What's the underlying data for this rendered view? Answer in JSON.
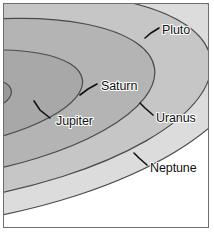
{
  "figure": {
    "background_color": "#ffffff",
    "frame_color": "#6e6e6e"
  },
  "sun": {
    "name": "Sun",
    "color": "#000000",
    "cx": -52,
    "cy": 96,
    "rx": 6.0,
    "ry": 4.2
  },
  "chart_data": {
    "type": "scatter",
    "subtitle": "Concentric tilted ellipses representing planetary orbits viewed obliquely",
    "xlabel": "",
    "ylabel": "",
    "grid": false,
    "legend": "none",
    "center": {
      "cx": -52,
      "cy": 96
    },
    "rotation_deg": -9,
    "categories": [
      "Jupiter",
      "Saturn",
      "Uranus",
      "Neptune",
      "Pluto"
    ],
    "series": [
      {
        "name": "orbit semi-axes",
        "values": [
          60,
          132,
          205,
          262,
          300
        ]
      }
    ],
    "orbits": [
      {
        "label": "Jupiter",
        "rx": 60,
        "ry": 21,
        "fill": "#9a9a9a",
        "stroke": "#3c3c3c",
        "label_x": 52,
        "label_y": 118,
        "leader": "M 46 114 L 36 106 L 30 97"
      },
      {
        "label": "Saturn",
        "rx": 132,
        "ry": 46,
        "fill": "#a8a8a8",
        "stroke": "#3c3c3c",
        "label_x": 97,
        "label_y": 83,
        "leader": "M 93 80 L 84 85 L 76 91"
      },
      {
        "label": "Uranus",
        "rx": 205,
        "ry": 76,
        "fill": "#b4b4b4",
        "stroke": "#4a4a4a",
        "label_x": 152,
        "label_y": 115,
        "leader": "M 149 111 L 141 104 L 136 99"
      },
      {
        "label": "Neptune",
        "rx": 262,
        "ry": 100,
        "fill": "#c6c6c6",
        "stroke": "#4a4a4a",
        "label_x": 146,
        "label_y": 165,
        "leader": "M 143 161 L 135 154 L 130 149"
      },
      {
        "label": "Pluto",
        "rx": 300,
        "ry": 122,
        "fill": "#dcdcdc",
        "stroke": "#4a4a4a",
        "label_x": 158,
        "label_y": 27,
        "leader": "M 155 24 L 147 29 L 141 34"
      }
    ]
  }
}
